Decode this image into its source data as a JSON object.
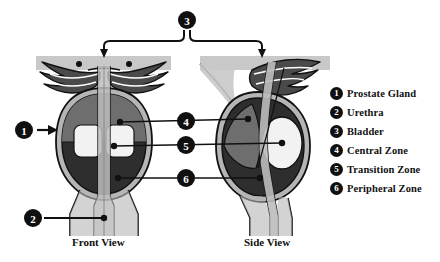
{
  "diagram": {
    "views": [
      {
        "id": "front",
        "label": "Front View"
      },
      {
        "id": "side",
        "label": "Side View"
      }
    ],
    "legend": [
      {
        "number": "1",
        "label": "Prostate Gland"
      },
      {
        "number": "2",
        "label": "Urethra"
      },
      {
        "number": "3",
        "label": "Bladder"
      },
      {
        "number": "4",
        "label": "Central Zone"
      },
      {
        "number": "5",
        "label": "Transition Zone"
      },
      {
        "number": "6",
        "label": "Peripheral Zone"
      }
    ],
    "callouts": [
      {
        "number": "1",
        "target": "prostate-gland",
        "style": "arrow-right"
      },
      {
        "number": "2",
        "target": "urethra",
        "style": "leader-line"
      },
      {
        "number": "3",
        "target": "bladder",
        "style": "bracket"
      },
      {
        "number": "4",
        "target": "central-zone",
        "style": "leader-line"
      },
      {
        "number": "5",
        "target": "transition-zone",
        "style": "leader-line"
      },
      {
        "number": "6",
        "target": "peripheral-zone",
        "style": "leader-line"
      }
    ],
    "colors": {
      "background": "#ffffff",
      "outline": "#111111",
      "bladder": "#c8c8c8",
      "capsule": "#b5b5b5",
      "central_zone": "#6e6e6e",
      "transition_zone": "#f2f2f2",
      "peripheral_zone": "#2e2e2e",
      "seminal_vesicle": "#4a4a4a",
      "urethra": "#bdbdbd",
      "badge_fill": "#101010",
      "badge_text": "#ffffff",
      "text": "#111111"
    }
  }
}
